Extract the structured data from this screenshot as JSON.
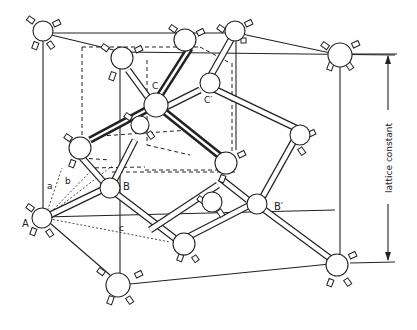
{
  "figure": {
    "labels": {
      "A": "A",
      "B": "B",
      "B_prime": "B′",
      "C": "C",
      "C_prime": "C′",
      "a": "a",
      "b": "b",
      "c": "c"
    },
    "dimension_label": "lattice constant"
  }
}
